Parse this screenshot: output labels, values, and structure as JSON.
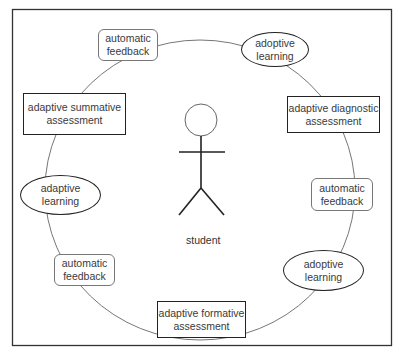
{
  "diagram": {
    "center": {
      "label": "student",
      "icon": "stick-figure-icon"
    },
    "nodes": [
      {
        "id": "n1",
        "label_lines": [
          "automatic",
          "feedback"
        ],
        "shape": "rounded-rect"
      },
      {
        "id": "n2",
        "label_lines": [
          "adoptive",
          "learning"
        ],
        "shape": "ellipse"
      },
      {
        "id": "n3",
        "label_lines": [
          "adaptive summative",
          "assessment"
        ],
        "shape": "rect"
      },
      {
        "id": "n4",
        "label_lines": [
          "adaptive diagnostic",
          "assessment"
        ],
        "shape": "rect"
      },
      {
        "id": "n5",
        "label_lines": [
          "adaptive",
          "learning"
        ],
        "shape": "ellipse"
      },
      {
        "id": "n6",
        "label_lines": [
          "automatic",
          "feedback"
        ],
        "shape": "rounded-rect"
      },
      {
        "id": "n7",
        "label_lines": [
          "automatic",
          "feedback"
        ],
        "shape": "rounded-rect"
      },
      {
        "id": "n8",
        "label_lines": [
          "adoptive",
          "learning"
        ],
        "shape": "ellipse"
      },
      {
        "id": "n9",
        "label_lines": [
          "adaptive formative",
          "assessment"
        ],
        "shape": "rect"
      }
    ],
    "cycle_order": [
      "n1",
      "n2",
      "n4",
      "n6",
      "n8",
      "n9",
      "n7",
      "n5",
      "n3"
    ],
    "colors": {
      "stroke": "#222222",
      "soft_stroke": "#777777",
      "background": "#ffffff"
    }
  }
}
